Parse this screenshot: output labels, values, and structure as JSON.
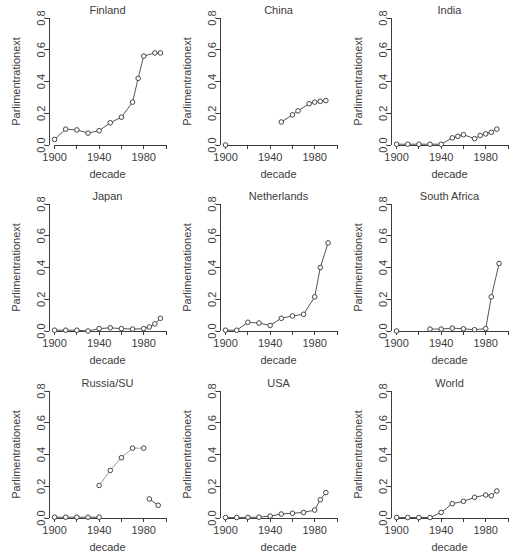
{
  "figure": {
    "axis_label_y": "Parlimentrationext",
    "axis_label_x": "decade",
    "y_ticks": [
      "0.0",
      "0.2",
      "0.4",
      "0.6",
      "0.8"
    ],
    "x_ticks_major": [
      "1900",
      "1940",
      "1980"
    ],
    "x_ticks_minor": [
      "1920",
      "1960",
      "2000"
    ],
    "colors": {
      "axis": "#3c3c3c",
      "text": "#3c3c3c",
      "line_primary": "#555555",
      "line_secondary": "#9a9a9a",
      "marker_stroke": "#444444",
      "marker_fill": "#ffffff",
      "background": "#ffffff"
    }
  },
  "chart_data": {
    "type": "line",
    "title": "",
    "xlabel": "decade",
    "ylabel": "Parlimentrationext",
    "xlim": [
      1895,
      2000
    ],
    "ylim": [
      0.0,
      0.8
    ],
    "grid": false,
    "legend": "none",
    "layout": {
      "rows": 3,
      "cols": 3
    },
    "panels": [
      {
        "title": "Finland",
        "segments": [
          {
            "color": "#555555",
            "x": [
              1900,
              1910,
              1920,
              1930,
              1940,
              1950,
              1960,
              1970,
              1975,
              1980,
              1990,
              1995
            ],
            "y": [
              0.035,
              0.1,
              0.095,
              0.075,
              0.09,
              0.14,
              0.175,
              0.27,
              0.42,
              0.56,
              0.58,
              0.58
            ]
          }
        ]
      },
      {
        "title": "China",
        "segments": [
          {
            "color": "#555555",
            "x": [
              1900
            ],
            "y": [
              0.0
            ]
          },
          {
            "color": "#555555",
            "x": [
              1950,
              1960,
              1965,
              1975,
              1980,
              1985,
              1990
            ],
            "y": [
              0.145,
              0.19,
              0.215,
              0.26,
              0.27,
              0.275,
              0.28
            ]
          }
        ]
      },
      {
        "title": "India",
        "segments": [
          {
            "color": "#555555",
            "x": [
              1900,
              1910,
              1920,
              1930,
              1940,
              1950,
              1955,
              1960,
              1970,
              1975,
              1980,
              1985,
              1990
            ],
            "y": [
              0.005,
              0.005,
              0.005,
              0.005,
              0.005,
              0.045,
              0.055,
              0.065,
              0.04,
              0.06,
              0.07,
              0.08,
              0.1
            ]
          }
        ]
      },
      {
        "title": "Japan",
        "segments": [
          {
            "color": "#555555",
            "x": [
              1900,
              1910,
              1920,
              1930,
              1940,
              1950,
              1960,
              1970,
              1980,
              1985,
              1990,
              1995
            ],
            "y": [
              0.005,
              0.005,
              0.005,
              0.0,
              0.015,
              0.02,
              0.015,
              0.012,
              0.015,
              0.025,
              0.045,
              0.08
            ]
          }
        ]
      },
      {
        "title": "Netherlands",
        "segments": [
          {
            "color": "#555555",
            "x": [
              1900,
              1910,
              1920,
              1930,
              1940,
              1950,
              1960,
              1970,
              1980,
              1985,
              1992
            ],
            "y": [
              0.005,
              0.005,
              0.055,
              0.05,
              0.035,
              0.08,
              0.095,
              0.105,
              0.215,
              0.4,
              0.555
            ]
          }
        ]
      },
      {
        "title": "South Africa",
        "segments": [
          {
            "color": "#555555",
            "x": [
              1900
            ],
            "y": [
              0.0
            ]
          },
          {
            "color": "#555555",
            "x": [
              1930,
              1940,
              1950,
              1960,
              1970,
              1980,
              1985,
              1992
            ],
            "y": [
              0.012,
              0.012,
              0.018,
              0.014,
              0.008,
              0.015,
              0.215,
              0.425
            ]
          }
        ]
      },
      {
        "title": "Russia/SU",
        "segments": [
          {
            "color": "#555555",
            "x": [
              1900,
              1910,
              1920,
              1930,
              1940
            ],
            "y": [
              0.005,
              0.005,
              0.005,
              0.005,
              0.005
            ]
          },
          {
            "color": "#9a9a9a",
            "x": [
              1940,
              1950,
              1960,
              1970,
              1980
            ],
            "y": [
              0.205,
              0.3,
              0.38,
              0.44,
              0.44
            ]
          },
          {
            "color": "#555555",
            "x": [
              1985,
              1993
            ],
            "y": [
              0.12,
              0.08
            ]
          }
        ]
      },
      {
        "title": "USA",
        "segments": [
          {
            "color": "#555555",
            "x": [
              1900,
              1910,
              1920,
              1930,
              1940,
              1950,
              1960,
              1970,
              1980,
              1985,
              1990
            ],
            "y": [
              0.003,
              0.003,
              0.004,
              0.005,
              0.012,
              0.025,
              0.03,
              0.035,
              0.05,
              0.115,
              0.16
            ]
          }
        ]
      },
      {
        "title": "World",
        "segments": [
          {
            "color": "#555555",
            "x": [
              1900,
              1910,
              1920,
              1930,
              1940,
              1950,
              1960,
              1970,
              1980,
              1985,
              1990
            ],
            "y": [
              0.003,
              0.003,
              0.003,
              0.003,
              0.035,
              0.09,
              0.105,
              0.13,
              0.145,
              0.14,
              0.17
            ]
          }
        ]
      }
    ]
  }
}
